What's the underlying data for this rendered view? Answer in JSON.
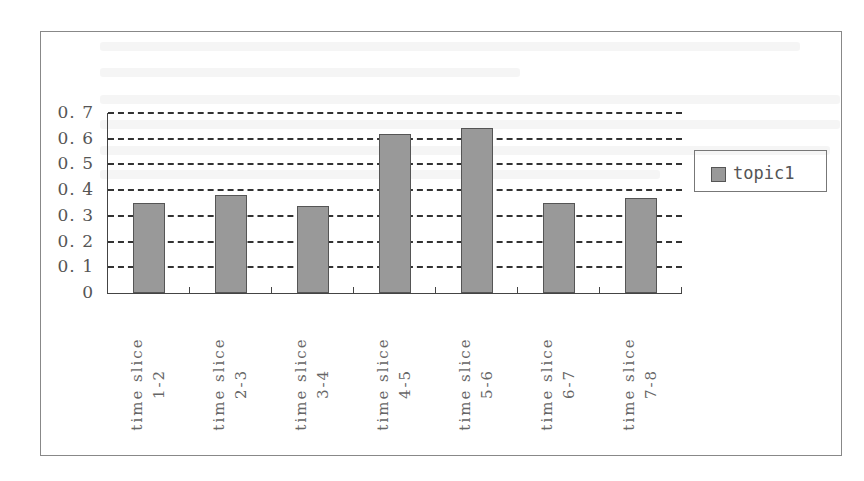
{
  "chart_data": {
    "type": "bar",
    "title": "",
    "xlabel": "",
    "ylabel": "",
    "categories": [
      [
        "time slice",
        "1-2"
      ],
      [
        "time slice",
        "2-3"
      ],
      [
        "time slice",
        "3-4"
      ],
      [
        "time slice",
        "4-5"
      ],
      [
        "time slice",
        "5-6"
      ],
      [
        "time slice",
        "6-7"
      ],
      [
        "time slice",
        "7-8"
      ]
    ],
    "series": [
      {
        "name": "topic1",
        "values": [
          0.35,
          0.38,
          0.34,
          0.62,
          0.64,
          0.35,
          0.37
        ],
        "color": "#999999"
      }
    ],
    "ylim": [
      0,
      0.7
    ],
    "yticks": [
      "0",
      "0.1",
      "0.2",
      "0.3",
      "0.4",
      "0.5",
      "0.6",
      "0.7"
    ],
    "grid": true,
    "grid_style": "dashed",
    "legend_position": "right",
    "x_label_rotation": -90
  },
  "legend": {
    "items": [
      {
        "label": "topic1",
        "color": "#999999"
      }
    ]
  },
  "colors": {
    "bar_fill": "#999999",
    "bar_border": "#555555",
    "axis": "#444444",
    "grid": "#333333",
    "frame": "#888888"
  }
}
